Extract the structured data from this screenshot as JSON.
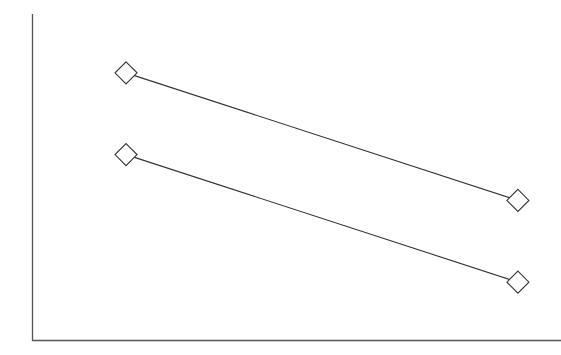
{
  "chart_data": {
    "type": "line",
    "title": "",
    "xlabel": "",
    "ylabel": "",
    "categories": [
      "",
      ""
    ],
    "x": [
      1,
      2
    ],
    "series": [
      {
        "name": "",
        "values": [
          8.2,
          4.3
        ],
        "marker": "diamond-open",
        "color": "#333333"
      },
      {
        "name": "",
        "values": [
          5.7,
          1.8
        ],
        "marker": "diamond-open",
        "color": "#333333"
      }
    ],
    "ylim": [
      0,
      10
    ],
    "xlim": [
      0.76,
      2.11
    ],
    "grid": false,
    "legend": null,
    "axis_color": "#555555"
  }
}
